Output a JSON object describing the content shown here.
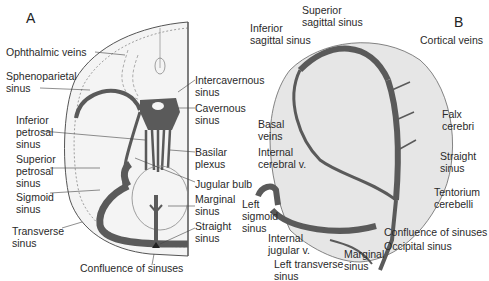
{
  "panels": {
    "a": {
      "letter": "A",
      "labels": {
        "ophthalmic_veins": "Ophthalmic veins",
        "sphenoparietal_sinus": "Sphenoparietal\nsinus",
        "inferior_petrosal_sinus": "Inferior\npetrosal\nsinus",
        "superior_petrosal_sinus": "Superior\npetrosal\nsinus",
        "sigmoid_sinus": "Sigmoid\nsinus",
        "transverse_sinus": "Transverse\nsinus",
        "confluence_of_sinuses": "Confluence of sinuses",
        "intercavernous_sinus": "Intercavernous\nsinus",
        "cavernous_sinus": "Cavernous\nsinus",
        "basilar_plexus": "Basilar\nplexus",
        "jugular_bulb": "Jugular bulb",
        "marginal_sinus": "Marginal\nsinus",
        "straight_sinus": "Straight\nsinus"
      }
    },
    "b": {
      "letter": "B",
      "labels": {
        "superior_sagittal_sinus": "Superior\nsagittal sinus",
        "inferior_sagittal_sinus": "Inferior\nsagittal sinus",
        "cortical_veins": "Cortical veins",
        "falx_cerebri": "Falx\ncerebri",
        "basal_veins": "Basal\nveins",
        "internal_cerebral_v": "Internal\ncerebral v.",
        "straight_sinus": "Straight\nsinus",
        "tentorium_cerebelli": "Tentorium\ncerebelli",
        "left_sigmoid_sinus": "Left\nsigmoid\nsinus",
        "internal_jugular_v": "Internal\njugular v.",
        "left_transverse_sinus": "Left transverse\nsinus",
        "marginal_sinus": "Marginal\nsinus",
        "confluence_of_sinuses": "Confluence of sinuses",
        "occipital_sinus": "Occipital sinus"
      }
    }
  },
  "colors": {
    "sinus": "#5a5a5a",
    "outline": "#444444",
    "tissue": "#eeeeee",
    "text": "#2a2a2a"
  }
}
